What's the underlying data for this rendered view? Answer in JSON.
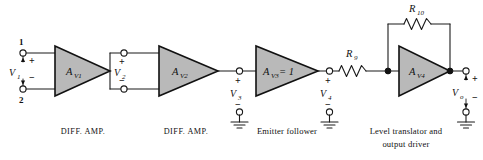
{
  "figure": {
    "background_color": "#ffffff",
    "line_color": "#1a1a1a",
    "amplifier_fill_color": "#b9b9b9"
  },
  "stages": [
    {
      "id": "av1",
      "gain_label": "A",
      "gain_subscript": "V1",
      "caption": "DIFF. AMP."
    },
    {
      "id": "av2",
      "gain_label": "A",
      "gain_subscript": "V2",
      "caption": "DIFF. AMP."
    },
    {
      "id": "av3",
      "gain_label": "A",
      "gain_subscript": "V3",
      "gain_value": "= 1",
      "caption": "Emitter follower"
    },
    {
      "id": "av4",
      "gain_label": "A",
      "gain_subscript": "V4",
      "caption_line1": "Level translator and",
      "caption_line2": "output driver"
    }
  ],
  "terminals": {
    "pin_top": "1",
    "pin_bottom": "2",
    "plus": "+",
    "minus": "−"
  },
  "nodes": [
    {
      "id": "v1",
      "label": "V",
      "subscript": "1",
      "plus": "+",
      "minus": "−"
    },
    {
      "id": "v2",
      "label": "V",
      "subscript": "2",
      "plus": "+",
      "minus": "−"
    },
    {
      "id": "v3",
      "label": "V",
      "subscript": "3",
      "plus": "+",
      "minus": "−"
    },
    {
      "id": "v4",
      "label": "V",
      "subscript": "4",
      "plus": "+",
      "minus": "−"
    },
    {
      "id": "vo",
      "label": "V",
      "subscript": "o",
      "plus": "+",
      "minus": "−"
    }
  ],
  "resistors": [
    {
      "id": "r9",
      "label": "R",
      "subscript": "9",
      "orientation": "horizontal",
      "position": "series-input-to-av4"
    },
    {
      "id": "r10",
      "label": "R",
      "subscript": "10",
      "orientation": "horizontal",
      "position": "feedback-around-av4"
    }
  ],
  "captions": {
    "stage1": "DIFF. AMP.",
    "stage2": "DIFF. AMP.",
    "stage3": "Emitter follower",
    "stage4_line1": "Level translator and",
    "stage4_line2": "output driver"
  }
}
